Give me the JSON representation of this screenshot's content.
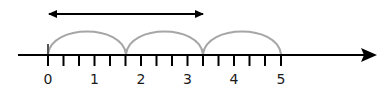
{
  "diagram": {
    "type": "number-line",
    "colors": {
      "line": "#000000",
      "arc": "#a6a6a6",
      "label": "#1a1a1a"
    },
    "axis": {
      "min": 0,
      "max": 5,
      "ticks_per_unit": 3
    },
    "labels": [
      "0",
      "1",
      "2",
      "3",
      "4",
      "5"
    ],
    "jumps": [
      {
        "from": "0",
        "to": "5/3"
      },
      {
        "from": "5/3",
        "to": "10/3"
      },
      {
        "from": "10/3",
        "to": "5"
      }
    ],
    "span_arrow": {
      "from": "0",
      "to": "10/3"
    }
  }
}
